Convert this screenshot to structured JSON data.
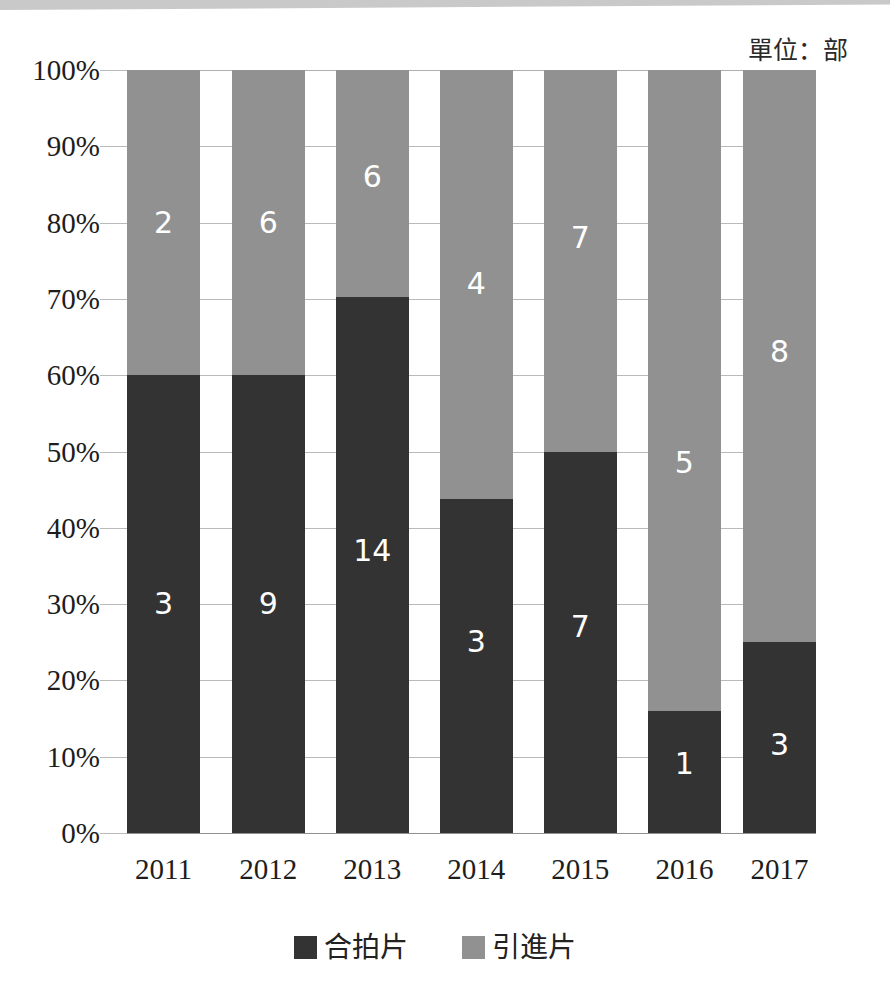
{
  "unit_caption": "單位：部",
  "legend": {
    "items": [
      {
        "label": "合拍片",
        "color": "#333333",
        "key": "coproduction"
      },
      {
        "label": "引進片",
        "color": "#919191",
        "key": "imported"
      }
    ]
  },
  "axis": {
    "y_ticks": [
      "0%",
      "10%",
      "20%",
      "30%",
      "40%",
      "50%",
      "60%",
      "70%",
      "80%",
      "90%",
      "100%"
    ],
    "x_ticks": [
      "2011",
      "2012",
      "2013",
      "2014",
      "2015",
      "2016",
      "2017"
    ]
  },
  "chart_data": {
    "type": "bar",
    "subtype": "100%-stacked-column",
    "title": "",
    "subtitle": "",
    "xlabel": "",
    "ylabel": "",
    "unit": "單位：部",
    "categories": [
      "2011",
      "2012",
      "2013",
      "2014",
      "2015",
      "2016",
      "2017"
    ],
    "series": [
      {
        "name": "合拍片",
        "color": "#333333",
        "stack_position": "bottom",
        "values": [
          3,
          9,
          14,
          3,
          7,
          1,
          3
        ],
        "percentages": [
          60.0,
          60.0,
          70.0,
          42.9,
          50.0,
          16.7,
          27.3
        ]
      },
      {
        "name": "引進片",
        "color": "#919191",
        "stack_position": "top",
        "values": [
          2,
          6,
          6,
          4,
          7,
          5,
          8
        ],
        "percentages": [
          40.0,
          40.0,
          30.0,
          57.1,
          50.0,
          83.3,
          72.7
        ]
      }
    ],
    "totals": [
      5,
      15,
      20,
      7,
      14,
      6,
      11
    ],
    "ylim": [
      0,
      100
    ],
    "ytick_labels": [
      "0%",
      "10%",
      "20%",
      "30%",
      "40%",
      "50%",
      "60%",
      "70%",
      "80%",
      "90%",
      "100%"
    ],
    "ytick_values": [
      0,
      10,
      20,
      30,
      40,
      50,
      60,
      70,
      80,
      90,
      100
    ],
    "grid": true,
    "grid_axis": "y",
    "legend_position": "bottom",
    "data_labels": true
  },
  "rendering": {
    "bar_geometry": [
      {
        "category": "2011",
        "left_pct": 0.0,
        "width_pct": 10.6,
        "bottom_pct": 60.0
      },
      {
        "category": "2012",
        "left_pct": 15.2,
        "width_pct": 10.6,
        "bottom_pct": 60.0
      },
      {
        "category": "2013",
        "left_pct": 30.3,
        "width_pct": 10.6,
        "bottom_pct": 70.3
      },
      {
        "category": "2014",
        "left_pct": 45.4,
        "width_pct": 10.6,
        "bottom_pct": 43.8
      },
      {
        "category": "2015",
        "left_pct": 60.5,
        "width_pct": 10.6,
        "bottom_pct": 50.0
      },
      {
        "category": "2016",
        "left_pct": 75.6,
        "width_pct": 10.6,
        "bottom_pct": 16.0
      },
      {
        "category": "2017",
        "left_pct": 89.4,
        "width_pct": 10.6,
        "bottom_pct": 25.0
      }
    ],
    "bottom_label_center_pct": [
      30.0,
      30.0,
      37.0,
      25.0,
      27.0,
      9.0,
      11.5
    ],
    "top_label_center_pct": [
      80.0,
      80.0,
      86.0,
      72.0,
      78.0,
      48.5,
      63.0
    ]
  }
}
